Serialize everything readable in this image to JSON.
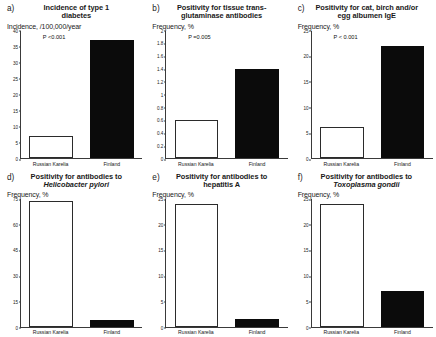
{
  "figure": {
    "categories": [
      "Russian Karelia",
      "Finland"
    ]
  },
  "panels": [
    {
      "letter": "a)",
      "title_line1": "Incidence of type 1",
      "title_line2": "diabetes",
      "axis_label": "Incidence, /100,000/year",
      "pvalue": "P <0.001",
      "ticks": [
        "40",
        "35",
        "30",
        "25",
        "20",
        "15",
        "10",
        "5",
        "0"
      ],
      "ymax": 40,
      "values": [
        7,
        37
      ]
    },
    {
      "letter": "b)",
      "title_line1": "Positivity for tissue trans-",
      "title_line2": "glutaminase antibodies",
      "axis_label": "Frequency, %",
      "pvalue": "P =0.005",
      "ticks": [
        "2",
        "1.8",
        "1.6",
        "1.4",
        "1.2",
        "1",
        "0.8",
        "0.6",
        "0.4",
        "0.2",
        "0"
      ],
      "ymax": 2,
      "values": [
        0.6,
        1.4
      ]
    },
    {
      "letter": "c)",
      "title_line1": "Positivity for cat, birch and/or",
      "title_line2": "egg albumen IgE",
      "axis_label": "Frequency, %",
      "pvalue": "P < 0.001",
      "ticks": [
        "25",
        "20",
        "15",
        "10",
        "5",
        "0"
      ],
      "ymax": 25,
      "values": [
        6,
        22
      ]
    },
    {
      "letter": "d)",
      "title_line1": "Positivity for antibodies to",
      "title_line2": "Helicobacter pylori",
      "title_line2_italic": true,
      "axis_label": "Frequency, %",
      "pvalue": "P <0.001",
      "ticks": [
        "75",
        "60",
        "45",
        "30",
        "15",
        "0"
      ],
      "ymax": 75,
      "values": [
        74,
        4
      ]
    },
    {
      "letter": "e)",
      "title_line1": "Positivity for antibodies to",
      "title_line2": "hepatitis A",
      "axis_label": "Frequency, %",
      "pvalue": "P < 0.001",
      "ticks": [
        "25",
        "20",
        "15",
        "10",
        "5",
        "0"
      ],
      "ymax": 25,
      "values": [
        24,
        1.5
      ]
    },
    {
      "letter": "f)",
      "title_line1": "Positivity for antibodies to",
      "title_line2": "Toxoplasma gondii",
      "title_line2_italic": true,
      "axis_label": "Frequency, %",
      "pvalue": "P < 0.001",
      "ticks": [
        "25",
        "20",
        "15",
        "10",
        "5",
        "0"
      ],
      "ymax": 25,
      "values": [
        24,
        7
      ]
    }
  ],
  "chart_data": [
    {
      "type": "bar",
      "title": "a) Incidence of type 1 diabetes",
      "ylabel": "Incidence, /100,000/year",
      "xlabel": "",
      "categories": [
        "Russian Karelia",
        "Finland"
      ],
      "values": [
        7,
        37
      ],
      "ylim": [
        0,
        40
      ],
      "yticks": [
        0,
        5,
        10,
        15,
        20,
        25,
        30,
        35,
        40
      ],
      "annotations": [
        "P <0.001"
      ],
      "grid": false,
      "legend": "none"
    },
    {
      "type": "bar",
      "title": "b) Positivity for tissue transglutaminase antibodies",
      "ylabel": "Frequency, %",
      "xlabel": "",
      "categories": [
        "Russian Karelia",
        "Finland"
      ],
      "values": [
        0.6,
        1.4
      ],
      "ylim": [
        0,
        2
      ],
      "yticks": [
        0,
        0.2,
        0.4,
        0.6,
        0.8,
        1,
        1.2,
        1.4,
        1.6,
        1.8,
        2
      ],
      "annotations": [
        "P =0.005"
      ],
      "grid": false,
      "legend": "none"
    },
    {
      "type": "bar",
      "title": "c) Positivity for cat, birch and/or egg albumen IgE",
      "ylabel": "Frequency, %",
      "xlabel": "",
      "categories": [
        "Russian Karelia",
        "Finland"
      ],
      "values": [
        6,
        22
      ],
      "ylim": [
        0,
        25
      ],
      "yticks": [
        0,
        5,
        10,
        15,
        20,
        25
      ],
      "annotations": [
        "P < 0.001"
      ],
      "grid": false,
      "legend": "none"
    },
    {
      "type": "bar",
      "title": "d) Positivity for antibodies to Helicobacter pylori",
      "ylabel": "Frequency, %",
      "xlabel": "",
      "categories": [
        "Russian Karelia",
        "Finland"
      ],
      "values": [
        74,
        4
      ],
      "ylim": [
        0,
        75
      ],
      "yticks": [
        0,
        15,
        30,
        45,
        60,
        75
      ],
      "annotations": [
        "P <0.001"
      ],
      "grid": false,
      "legend": "none"
    },
    {
      "type": "bar",
      "title": "e) Positivity for antibodies to hepatitis A",
      "ylabel": "Frequency, %",
      "xlabel": "",
      "categories": [
        "Russian Karelia",
        "Finland"
      ],
      "values": [
        24,
        1.5
      ],
      "ylim": [
        0,
        25
      ],
      "yticks": [
        0,
        5,
        10,
        15,
        20,
        25
      ],
      "annotations": [
        "P < 0.001"
      ],
      "grid": false,
      "legend": "none"
    },
    {
      "type": "bar",
      "title": "f) Positivity for antibodies to Toxoplasma gondii",
      "ylabel": "Frequency, %",
      "xlabel": "",
      "categories": [
        "Russian Karelia",
        "Finland"
      ],
      "values": [
        24,
        7
      ],
      "ylim": [
        0,
        25
      ],
      "yticks": [
        0,
        5,
        10,
        15,
        20,
        25
      ],
      "annotations": [
        "P < 0.001"
      ],
      "grid": false,
      "legend": "none"
    }
  ]
}
